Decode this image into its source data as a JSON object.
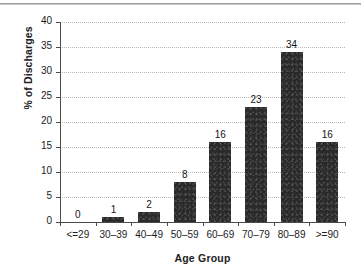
{
  "chart_data": {
    "type": "bar",
    "title": "",
    "subtitle": "",
    "xlabel": "Age Group",
    "ylabel": "% of Discharges",
    "categories": [
      "<=29",
      "30–39",
      "40–49",
      "50–59",
      "60–69",
      "70–79",
      "80–89",
      ">=90"
    ],
    "values": [
      0,
      1,
      2,
      8,
      16,
      23,
      34,
      16
    ],
    "data_labels": [
      "0",
      "1",
      "2",
      "8",
      "16",
      "23",
      "34",
      "16"
    ],
    "ylim": [
      0,
      40
    ],
    "ytick_labels": [
      "40",
      "35",
      "30",
      "25",
      "20",
      "15",
      "10",
      "5",
      "0"
    ],
    "ytick_values": [
      40,
      35,
      30,
      25,
      20,
      15,
      10,
      5,
      0
    ],
    "ytick_step": 5,
    "grid": true,
    "grid_axis": "y",
    "grid_style": "dotted",
    "legend": false,
    "legend_position": "none",
    "bar_color": "#2a2a2a",
    "grid_color": "#b9b9b9",
    "axis_color": "#4a4a4a",
    "text_color": "#1c1c1c",
    "background": "#ffffff"
  },
  "figure": {
    "has_top_rule": true,
    "top_rule_color": "#8f8f8f"
  }
}
